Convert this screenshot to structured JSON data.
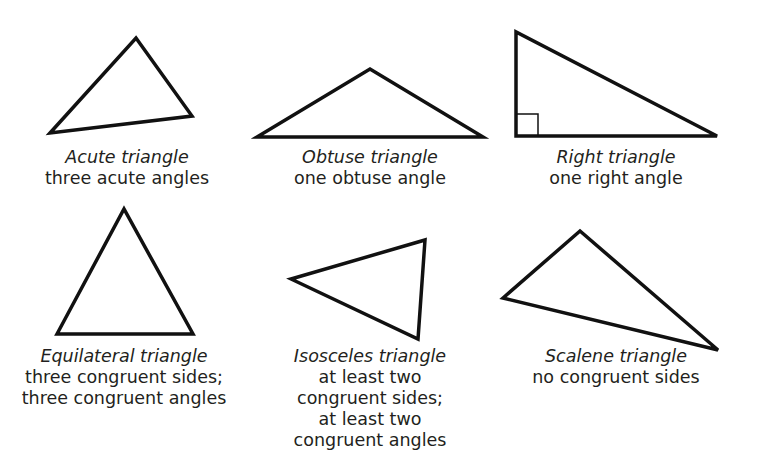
{
  "figure": {
    "stroke_color": "#111111",
    "background": "#ffffff",
    "triangles": [
      {
        "name": "Acute triangle",
        "description": [
          "three acute angles"
        ],
        "points": "50,133 136,38 192,116",
        "caption_x": 127,
        "caption_y": 147
      },
      {
        "name": "Obtuse triangle",
        "description": [
          "one obtuse angle"
        ],
        "points": "257,137 370,69 483,137",
        "caption_x": 370,
        "caption_y": 147
      },
      {
        "name": "Right triangle",
        "description": [
          "one right angle"
        ],
        "points": "516,32 516,136 717,136",
        "right_angle_marker": "516,114 538,114 538,136",
        "caption_x": 616,
        "caption_y": 147
      },
      {
        "name": "Equilateral triangle",
        "description": [
          "three congruent sides;",
          "three congruent angles"
        ],
        "points": "57,334 124,209 193,334",
        "caption_x": 124,
        "caption_y": 346
      },
      {
        "name": "Isosceles triangle",
        "description": [
          "at least two",
          "congruent sides;",
          "at least two",
          "congruent angles"
        ],
        "points": "291,279 425,240 418,339",
        "caption_x": 370,
        "caption_y": 346
      },
      {
        "name": "Scalene triangle",
        "description": [
          "no congruent sides"
        ],
        "points": "503,298 580,231 718,350",
        "caption_x": 616,
        "caption_y": 346
      }
    ]
  }
}
